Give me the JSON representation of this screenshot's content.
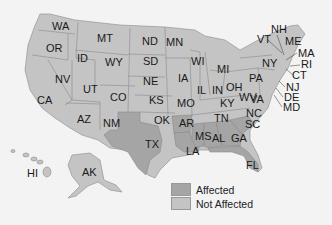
{
  "map": {
    "colors": {
      "affected": "#a5a5a5",
      "not_affected": "#c4c4c4",
      "border": "#8a8a8a",
      "background": "#f3f3f3"
    },
    "affected_states": [
      "TX",
      "AR",
      "LA",
      "MS",
      "AL",
      "GA",
      "FL",
      "SC"
    ],
    "labels": {
      "WA": "WA",
      "OR": "OR",
      "CA": "CA",
      "ID": "ID",
      "NV": "NV",
      "MT": "MT",
      "WY": "WY",
      "UT": "UT",
      "AZ": "AZ",
      "CO": "CO",
      "NM": "NM",
      "ND": "ND",
      "SD": "SD",
      "NE": "NE",
      "KS": "KS",
      "OK": "OK",
      "TX": "TX",
      "MN": "MN",
      "IA": "IA",
      "MO": "MO",
      "AR": "AR",
      "LA": "LA",
      "WI": "WI",
      "IL": "IL",
      "MS": "MS",
      "MI": "MI",
      "IN": "IN",
      "KY": "KY",
      "TN": "TN",
      "AL": "AL",
      "OH": "OH",
      "WV": "WV",
      "VA": "VA",
      "NC": "NC",
      "SC": "SC",
      "GA": "GA",
      "FL": "FL",
      "PA": "PA",
      "NY": "NY",
      "VT": "VT",
      "NH": "NH",
      "ME": "ME",
      "MA": "MA",
      "RI": "RI",
      "CT": "CT",
      "NJ": "NJ",
      "DE": "DE",
      "MD": "MD",
      "AK": "AK",
      "HI": "HI"
    }
  },
  "legend": {
    "items": [
      {
        "label": "Affected",
        "color": "#a5a5a5"
      },
      {
        "label": "Not Affected",
        "color": "#c4c4c4"
      }
    ]
  }
}
